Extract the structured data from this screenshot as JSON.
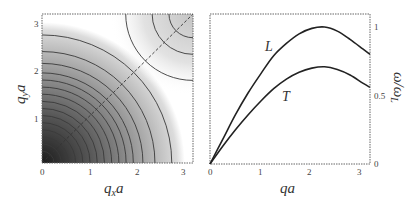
{
  "chart_data": [
    {
      "type": "heatmap",
      "title": "",
      "xlabel": "q_x a",
      "ylabel": "q_y a",
      "xlim": [
        0,
        3.14159
      ],
      "ylim": [
        0,
        3.14159
      ],
      "x_ticks": [
        "0",
        "1",
        "2",
        "3"
      ],
      "y_ticks": [
        "1",
        "2",
        "3"
      ],
      "grid": false,
      "description": "Contour plot of phonon frequency over the first Brillouin zone quadrant; darkest at origin, lightening outward with concentric quarter-circle contours; a second set of contours near the (π,π) corner; dashed diagonal from origin to (π,π).",
      "contour_radii": [
        0.25,
        0.4,
        0.55,
        0.7,
        0.85,
        1.0,
        1.15,
        1.3,
        1.45,
        1.6,
        1.75,
        1.9,
        2.1,
        2.35,
        2.7
      ],
      "corner_contour_radii": [
        0.5,
        0.85,
        1.4
      ],
      "dashed_line": {
        "from": [
          0,
          0
        ],
        "to": [
          3.14159,
          3.14159
        ]
      }
    },
    {
      "type": "line",
      "title": "",
      "xlabel": "qa",
      "ylabel": "ω/ω_L",
      "xlim": [
        0,
        3.14159
      ],
      "ylim": [
        0,
        1.05
      ],
      "x_ticks": [
        "0",
        "1",
        "2",
        "3"
      ],
      "y_ticks": [
        "0",
        "0.5",
        "1"
      ],
      "y_axis_position": "right",
      "grid": false,
      "series": [
        {
          "name": "L",
          "x": [
            0,
            0.25,
            0.5,
            0.75,
            1.0,
            1.25,
            1.5,
            1.75,
            2.0,
            2.25,
            2.5,
            2.75,
            3.0,
            3.14
          ],
          "values": [
            0,
            0.18,
            0.36,
            0.52,
            0.66,
            0.79,
            0.88,
            0.95,
            0.99,
            1.0,
            0.97,
            0.91,
            0.84,
            0.8
          ]
        },
        {
          "name": "T",
          "x": [
            0,
            0.25,
            0.5,
            0.75,
            1.0,
            1.25,
            1.5,
            1.75,
            2.0,
            2.25,
            2.5,
            2.75,
            3.0,
            3.14
          ],
          "values": [
            0,
            0.13,
            0.25,
            0.36,
            0.46,
            0.55,
            0.62,
            0.67,
            0.7,
            0.71,
            0.69,
            0.65,
            0.59,
            0.56
          ]
        }
      ],
      "annotations": [
        {
          "text": "L",
          "x": 1.15,
          "y": 0.83
        },
        {
          "text": "T",
          "x": 1.5,
          "y": 0.5
        }
      ]
    }
  ],
  "labels": {
    "left": {
      "xlabel_main": "q",
      "xlabel_sub": "x",
      "xlabel_tail": "a",
      "ylabel_main": "q",
      "ylabel_sub": "y",
      "ylabel_tail": "a",
      "xticks": [
        "0",
        "1",
        "2",
        "3"
      ],
      "yticks": [
        "1",
        "2",
        "3"
      ]
    },
    "right": {
      "xlabel": "qa",
      "ylabel": "ω/ω",
      "ylabel_sub": "L",
      "xticks": [
        "0",
        "1",
        "2",
        "3"
      ],
      "yticks": [
        "0",
        "0.5",
        "1"
      ],
      "curve_L": "L",
      "curve_T": "T"
    }
  }
}
